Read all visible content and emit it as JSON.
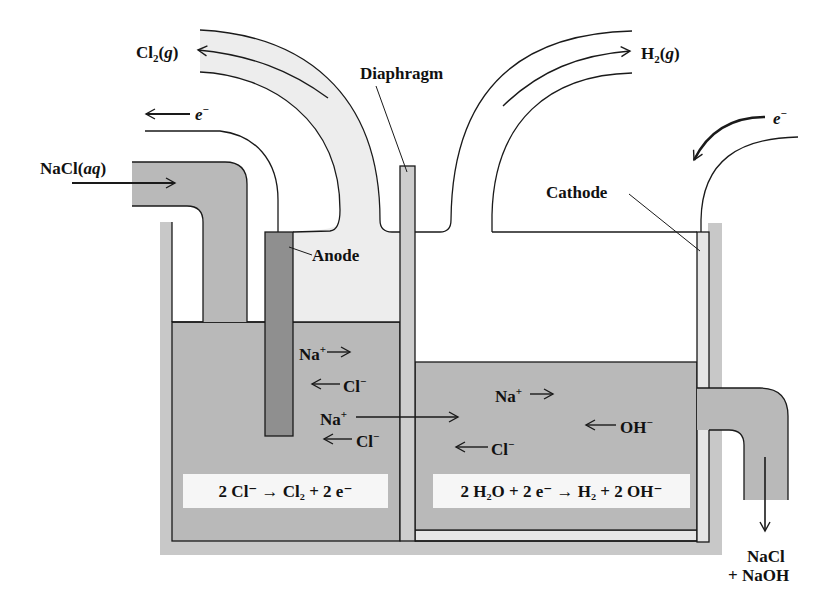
{
  "colors": {
    "outer_container": "#c8c8c8",
    "solution": "#b9b9b9",
    "gas_space_light": "#ededed",
    "anode": "#8f8f8f",
    "diaphragm": "#cdcdcd",
    "cathode": "#e6e6e6",
    "equation_box": "#f6f6f6",
    "stroke": "#1a1a1a"
  },
  "labels": {
    "cl2_gas": {
      "base": "Cl",
      "sub": "2",
      "state": "g"
    },
    "h2_gas": {
      "base": "H",
      "sub": "2",
      "state": "g"
    },
    "diaphragm": "Diaphragm",
    "anode": "Anode",
    "cathode": "Cathode",
    "electron_left": {
      "base": "e",
      "sup": "−"
    },
    "electron_right": {
      "base": "e",
      "sup": "−"
    },
    "nacl_input": {
      "base": "NaCl(",
      "state": "aq",
      "close": ")"
    },
    "output_line1": "NaCl",
    "output_line2": "+ NaOH"
  },
  "ions": {
    "left": [
      {
        "text": "Na",
        "sup": "+",
        "direction": "right"
      },
      {
        "text": "Cl",
        "sup": "−",
        "direction": "left"
      },
      {
        "text": "Na",
        "sup": "+",
        "direction": "right",
        "crosses_diaphragm": true
      },
      {
        "text": "Cl",
        "sup": "−",
        "direction": "left"
      }
    ],
    "right": [
      {
        "text": "Na",
        "sup": "+",
        "direction": "right"
      },
      {
        "text": "OH",
        "sup": "−",
        "direction": "left"
      },
      {
        "text": "Cl",
        "sup": "−",
        "direction": "left"
      }
    ]
  },
  "equations": {
    "anode": "2 Cl⁻ → Cl₂ + 2 e⁻",
    "cathode": "2 H₂O + 2 e⁻ → H₂ + 2 OH⁻"
  }
}
